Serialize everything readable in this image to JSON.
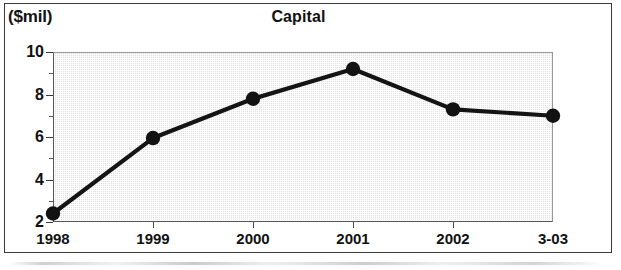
{
  "chart_data": {
    "type": "line",
    "title": "Capital",
    "xlabel": "",
    "ylabel": "($mil)",
    "unit_label": "($mil)",
    "categories": [
      "1998",
      "1999",
      "2000",
      "2001",
      "2002",
      "3-03"
    ],
    "values": [
      2.4,
      5.95,
      7.8,
      9.2,
      7.3,
      7.0
    ],
    "series": [
      {
        "name": "Capital",
        "values": [
          2.4,
          5.95,
          7.8,
          9.2,
          7.3,
          7.0
        ]
      }
    ],
    "ylim": [
      2,
      10
    ],
    "ytick_labels": [
      "10",
      "8",
      "6",
      "4",
      "2"
    ],
    "ytick_values": [
      10,
      8,
      6,
      4,
      2
    ],
    "yminor_values": [
      9,
      7,
      5,
      3
    ],
    "grid": false,
    "legend": false,
    "legend_position": "none",
    "marker": "filled-circle",
    "line_color": "#141414",
    "marker_color": "#121212",
    "plot_background": "#e3e3e3",
    "frame_color": "#3c3c3c"
  }
}
